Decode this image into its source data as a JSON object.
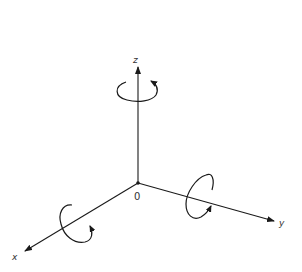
{
  "diagram": {
    "origin": {
      "label": "0",
      "x": 138,
      "y": 183
    },
    "axes": [
      {
        "name": "x",
        "label": "x",
        "end": [
          24,
          252
        ]
      },
      {
        "name": "y",
        "label": "y",
        "end": [
          275,
          221
        ]
      },
      {
        "name": "z",
        "label": "z",
        "end": [
          138,
          66
        ]
      }
    ],
    "rotations": [
      {
        "axis": "z",
        "direction": "counterclockwise-viewed-from-above"
      },
      {
        "axis": "x",
        "direction": "right-hand"
      },
      {
        "axis": "y",
        "direction": "right-hand"
      }
    ],
    "colors": {
      "stroke": "#1a1a1a",
      "background": "#ffffff"
    }
  }
}
